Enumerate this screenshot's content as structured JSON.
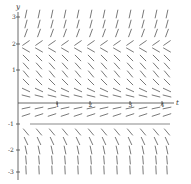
{
  "chart_data": {
    "type": "direction_field",
    "title": "",
    "xlabel": "t",
    "ylabel": "y",
    "x_ticks": [
      "1",
      "2",
      "3",
      "4"
    ],
    "y_ticks": [
      "3",
      "2",
      "1",
      "-1",
      "-2",
      "-3"
    ],
    "xlim": [
      -0.3,
      4.3
    ],
    "ylim": [
      -3.2,
      3.6
    ],
    "grid": false,
    "equilibrium_lines": [
      {
        "y": 0,
        "label": "t-axis"
      },
      {
        "y": -1,
        "label": "equilibrium"
      }
    ],
    "pixel_layout": {
      "y_axis_x": 18,
      "t_axis_y": 103,
      "x_tick_px": [
        57,
        90,
        130,
        162
      ],
      "y_tick_px": [
        17,
        44,
        70,
        124,
        150,
        172
      ],
      "columns_px": [
        26,
        39,
        52,
        65,
        78,
        91,
        104,
        117,
        130,
        143,
        156,
        167
      ],
      "seg_len": 8
    },
    "rows": [
      {
        "y_px": 14,
        "angle": 78
      },
      {
        "y_px": 24,
        "angle": 75
      },
      {
        "y_px": 33,
        "angle": 70
      },
      {
        "y_px": 43,
        "angle": 35
      },
      {
        "y_px": 50,
        "angle": -30
      },
      {
        "y_px": 58,
        "angle": -45
      },
      {
        "y_px": 66,
        "angle": -48
      },
      {
        "y_px": 74,
        "angle": -50
      },
      {
        "y_px": 82,
        "angle": -45
      },
      {
        "y_px": 90,
        "angle": -25
      },
      {
        "y_px": 96,
        "angle": -14
      },
      {
        "y_px": 108,
        "angle": 12
      },
      {
        "y_px": 115,
        "angle": 18
      },
      {
        "y_px": 132,
        "angle": -50
      },
      {
        "y_px": 141,
        "angle": -65
      },
      {
        "y_px": 150,
        "angle": -78
      },
      {
        "y_px": 160,
        "angle": -85
      },
      {
        "y_px": 170,
        "angle": -87
      }
    ]
  }
}
